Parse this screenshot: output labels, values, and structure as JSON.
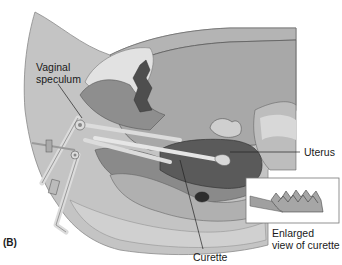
{
  "figure": {
    "panel_label": "(B)",
    "labels": {
      "vaginal_speculum_line1": "Vaginal",
      "vaginal_speculum_line2": "speculum",
      "uterus": "Uterus",
      "curette": "Curette",
      "enlarged_line1": "Enlarged",
      "enlarged_line2": "view of curette"
    },
    "colors": {
      "body": "#c4c4c4",
      "tissue_light": "#d6d6d6",
      "tissue_mid": "#9a9a9a",
      "tissue_dark": "#6e6e6e",
      "organ_dark": "#4a4a4a",
      "instrument": "#dcdcdc",
      "outline": "#555555",
      "background": "#ffffff"
    }
  }
}
